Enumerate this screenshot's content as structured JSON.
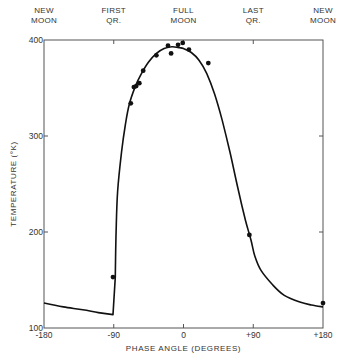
{
  "chart_data": {
    "type": "line",
    "title": "",
    "xlabel": "PHASE ANGLE (DEGREES)",
    "ylabel": "TEMPERATURE (°K)",
    "xlim": [
      -180,
      180
    ],
    "ylim": [
      100,
      400
    ],
    "grid": false,
    "x_ticks": [
      {
        "value": -180,
        "label": "-180"
      },
      {
        "value": -90,
        "label": "-90"
      },
      {
        "value": 0,
        "label": "0"
      },
      {
        "value": 90,
        "label": "+90"
      },
      {
        "value": 180,
        "label": "+180"
      }
    ],
    "y_ticks": [
      {
        "value": 100,
        "label": "100"
      },
      {
        "value": 200,
        "label": "200"
      },
      {
        "value": 300,
        "label": "300"
      },
      {
        "value": 400,
        "label": "400"
      }
    ],
    "top_labels": [
      {
        "value": -180,
        "line1": "NEW",
        "line2": "MOON"
      },
      {
        "value": -90,
        "line1": "FIRST",
        "line2": "QR."
      },
      {
        "value": 0,
        "line1": "FULL",
        "line2": "MOON"
      },
      {
        "value": 90,
        "line1": "LAST",
        "line2": "QR."
      },
      {
        "value": 180,
        "line1": "NEW",
        "line2": "MOON"
      }
    ],
    "series": [
      {
        "name": "Theoretical curve",
        "kind": "line",
        "x": [
          -180,
          -155,
          -130,
          -110,
          -91,
          -88,
          -87,
          -85,
          -80,
          -75,
          -70,
          -62,
          -55,
          -45,
          -35,
          -25,
          -15,
          -5,
          0,
          10,
          20,
          30,
          40,
          50,
          60,
          70,
          80,
          87,
          92,
          100,
          115,
          130,
          150,
          165,
          180
        ],
        "y": [
          126,
          122,
          119,
          116,
          114,
          153,
          200,
          242,
          283,
          312,
          333,
          352,
          364,
          377,
          386,
          391,
          393,
          392,
          391,
          387,
          379,
          365,
          344,
          316,
          283,
          246,
          212,
          192,
          175,
          160,
          145,
          134,
          127,
          124,
          122
        ]
      },
      {
        "name": "Observed",
        "kind": "scatter",
        "x": [
          -91,
          -68,
          -64,
          -61,
          -57,
          -52,
          -35,
          -20,
          -16,
          -7,
          -1,
          7,
          32,
          85,
          180
        ],
        "y": [
          153,
          334,
          351,
          352,
          355,
          368,
          384,
          394,
          386,
          395,
          397,
          390,
          376,
          197,
          126
        ]
      }
    ]
  }
}
